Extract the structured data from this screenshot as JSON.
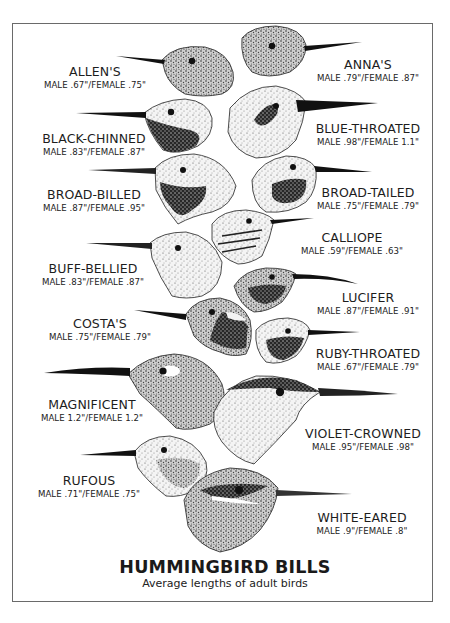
{
  "figure": {
    "title": "HUMMINGBIRD BILLS",
    "subtitle": "Average lengths of adult birds"
  },
  "species": [
    {
      "name": "ALLEN'S",
      "measurement": "MALE .67\"/FEMALE .75\"",
      "male_in": 0.67,
      "female_in": 0.75
    },
    {
      "name": "ANNA'S",
      "measurement": "MALE .79\"/FEMALE .87\"",
      "male_in": 0.79,
      "female_in": 0.87
    },
    {
      "name": "BLACK-CHINNED",
      "measurement": "MALE .83\"/FEMALE .87\"",
      "male_in": 0.83,
      "female_in": 0.87
    },
    {
      "name": "BLUE-THROATED",
      "measurement": "MALE .98\"/FEMALE 1.1\"",
      "male_in": 0.98,
      "female_in": 1.1
    },
    {
      "name": "BROAD-BILLED",
      "measurement": "MALE .87\"/FEMALE .95\"",
      "male_in": 0.87,
      "female_in": 0.95
    },
    {
      "name": "BROAD-TAILED",
      "measurement": "MALE .75\"/FEMALE .79\"",
      "male_in": 0.75,
      "female_in": 0.79
    },
    {
      "name": "CALLIOPE",
      "measurement": "MALE .59\"/FEMALE .63\"",
      "male_in": 0.59,
      "female_in": 0.63
    },
    {
      "name": "BUFF-BELLIED",
      "measurement": "MALE .83\"/FEMALE .87\"",
      "male_in": 0.83,
      "female_in": 0.87
    },
    {
      "name": "LUCIFER",
      "measurement": "MALE .87\"/FEMALE .91\"",
      "male_in": 0.87,
      "female_in": 0.91
    },
    {
      "name": "COSTA'S",
      "measurement": "MALE .75\"/FEMALE .79\"",
      "male_in": 0.75,
      "female_in": 0.79
    },
    {
      "name": "RUBY-THROATED",
      "measurement": "MALE .67\"/FEMALE .79\"",
      "male_in": 0.67,
      "female_in": 0.79
    },
    {
      "name": "MAGNIFICENT",
      "measurement": "MALE 1.2\"/FEMALE 1.2\"",
      "male_in": 1.2,
      "female_in": 1.2
    },
    {
      "name": "VIOLET-CROWNED",
      "measurement": "MALE .95\"/FEMALE .98\"",
      "male_in": 0.95,
      "female_in": 0.98
    },
    {
      "name": "RUFOUS",
      "measurement": "MALE .71\"/FEMALE .75\"",
      "male_in": 0.71,
      "female_in": 0.75
    },
    {
      "name": "WHITE-EARED",
      "measurement": "MALE .9\"/FEMALE .8\"",
      "male_in": 0.9,
      "female_in": 0.8
    }
  ],
  "colors": {
    "ink": "#1a1a1a",
    "border": "#6a6a6a",
    "background": "#ffffff"
  }
}
